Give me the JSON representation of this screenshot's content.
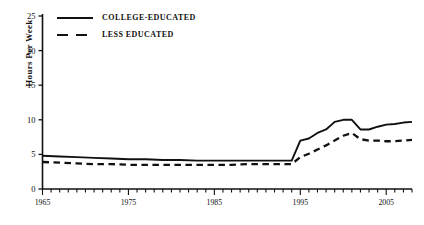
{
  "chart_data": {
    "type": "line",
    "title": "",
    "subtitle": "",
    "xlabel": "",
    "ylabel": "Hours Per Week",
    "xlim": [
      1965,
      2008
    ],
    "ylim": [
      0,
      25
    ],
    "yticks": [
      0,
      5,
      10,
      15,
      20,
      25
    ],
    "ytick_labels": [
      "0",
      "5",
      "10",
      "15",
      "20",
      "25"
    ],
    "xticks": [
      1965,
      1975,
      1985,
      1995,
      2005
    ],
    "xtick_labels": [
      "1965",
      "1975",
      "1985",
      "1995",
      "2005"
    ],
    "minor_xtick_interval": 1,
    "grid": false,
    "legend_position": "top-left",
    "series": [
      {
        "name": "COLLEGE-EDUCATED",
        "style": "solid",
        "color": "#111111",
        "x": [
          1965,
          1967,
          1969,
          1971,
          1973,
          1975,
          1977,
          1979,
          1981,
          1983,
          1985,
          1987,
          1989,
          1991,
          1993,
          1994,
          1995,
          1996,
          1997,
          1998,
          1999,
          2000,
          2001,
          2002,
          2003,
          2004,
          2005,
          2006,
          2007,
          2008
        ],
        "values": [
          4.8,
          4.7,
          4.6,
          4.5,
          4.4,
          4.3,
          4.3,
          4.2,
          4.2,
          4.1,
          4.1,
          4.1,
          4.1,
          4.1,
          4.1,
          4.1,
          7.0,
          7.3,
          8.1,
          8.6,
          9.7,
          10.0,
          10.0,
          8.6,
          8.6,
          9.0,
          9.3,
          9.4,
          9.6,
          9.7
        ]
      },
      {
        "name": "LESS EDUCATED",
        "style": "dashed",
        "color": "#111111",
        "x": [
          1965,
          1967,
          1969,
          1971,
          1973,
          1975,
          1977,
          1979,
          1981,
          1983,
          1985,
          1987,
          1989,
          1991,
          1993,
          1994,
          1995,
          1996,
          1997,
          1998,
          1999,
          2000,
          2001,
          2002,
          2003,
          2004,
          2005,
          2006,
          2007,
          2008
        ],
        "values": [
          3.9,
          3.8,
          3.7,
          3.6,
          3.6,
          3.5,
          3.5,
          3.5,
          3.5,
          3.5,
          3.5,
          3.5,
          3.6,
          3.6,
          3.6,
          3.6,
          4.6,
          5.1,
          5.7,
          6.3,
          7.0,
          7.7,
          8.1,
          7.2,
          7.0,
          7.0,
          6.9,
          6.9,
          7.0,
          7.1
        ]
      }
    ]
  },
  "axis": {
    "y_label_text": "Hours Per Week"
  },
  "legend": {
    "entries": [
      {
        "label": "COLLEGE-EDUCATED",
        "style": "solid"
      },
      {
        "label": "LESS EDUCATED",
        "style": "dashed"
      }
    ]
  }
}
